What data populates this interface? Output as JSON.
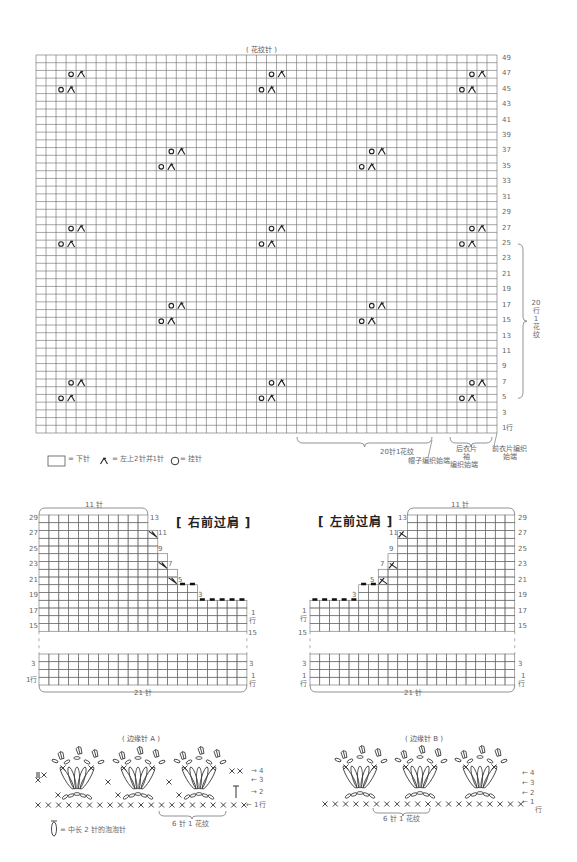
{
  "main_chart": {
    "title": "( 花纹针 )",
    "rows": 49,
    "cols": 46,
    "grid": {
      "x": 36,
      "y": 55,
      "w": 461,
      "h": 378
    },
    "row_labels": [
      "49",
      "47",
      "45",
      "43",
      "41",
      "39",
      "37",
      "35",
      "33",
      "31",
      "29",
      "27",
      "25",
      "23",
      "21",
      "19",
      "17",
      "15",
      "13",
      "11",
      "9",
      "7",
      "5",
      "3",
      "1行"
    ],
    "motifs": [
      {
        "row": 47,
        "col": 4
      },
      {
        "row": 45,
        "col": 3
      },
      {
        "row": 47,
        "col": 24
      },
      {
        "row": 45,
        "col": 23
      },
      {
        "row": 47,
        "col": 44
      },
      {
        "row": 45,
        "col": 43
      },
      {
        "row": 37,
        "col": 14
      },
      {
        "row": 35,
        "col": 13
      },
      {
        "row": 37,
        "col": 34
      },
      {
        "row": 35,
        "col": 33
      },
      {
        "row": 27,
        "col": 4
      },
      {
        "row": 25,
        "col": 3
      },
      {
        "row": 27,
        "col": 24
      },
      {
        "row": 25,
        "col": 23
      },
      {
        "row": 27,
        "col": 44
      },
      {
        "row": 25,
        "col": 43
      },
      {
        "row": 17,
        "col": 14
      },
      {
        "row": 15,
        "col": 13
      },
      {
        "row": 17,
        "col": 34
      },
      {
        "row": 15,
        "col": 33
      },
      {
        "row": 7,
        "col": 4
      },
      {
        "row": 5,
        "col": 3
      },
      {
        "row": 7,
        "col": 24
      },
      {
        "row": 5,
        "col": 23
      },
      {
        "row": 7,
        "col": 44
      },
      {
        "row": 5,
        "col": 43
      }
    ],
    "repeat_bracket_label": "20行1花纹",
    "repeat_bracket_chars": [
      "20",
      "行",
      "1",
      "花",
      "纹"
    ],
    "bottom_labels": {
      "pattern_repeat": "20针1花纹",
      "hat_start": "帽子编织始端",
      "back_sleeve_start": [
        "后衣片",
        "袖",
        "编织始端"
      ],
      "front_start": [
        "前衣片编织",
        "始端"
      ]
    },
    "legend": {
      "knit": "= 下针",
      "k2tog": "= 左上2针并1针",
      "yo": "= 挂针"
    }
  },
  "right_shoulder": {
    "title": "[ 右前过肩 ]",
    "top_label": "11 针",
    "bottom_label": "21 针",
    "left_row_labels": [
      "29",
      "27",
      "25",
      "23",
      "21",
      "19",
      "17",
      "15",
      "3",
      "1行"
    ],
    "right_step_labels": [
      "13",
      "11",
      "9",
      "7",
      "5",
      "3"
    ],
    "right_end_labels": [
      "1",
      "行",
      "15",
      "3",
      "1",
      "行"
    ]
  },
  "left_shoulder": {
    "title": "[ 左前过肩 ]",
    "top_label": "11 针",
    "bottom_label": "21 针",
    "right_row_labels": [
      "29",
      "27",
      "25",
      "23",
      "21",
      "19",
      "17",
      "15",
      "3"
    ],
    "left_step_labels": [
      "13",
      "11",
      "9",
      "7",
      "5",
      "3"
    ],
    "left_end_labels": [
      "1",
      "行",
      "15",
      "3",
      "1",
      "行"
    ],
    "right_end_labels": [
      "1",
      "行"
    ]
  },
  "edging_a": {
    "title": "( 边缘针 A )",
    "row_arrows": [
      "→ 4",
      "← 3",
      "→ 2",
      "← 1行"
    ],
    "repeat_label": "6 针 1 花纹",
    "bobble_legend": "= 中长 2 针的泡泡针"
  },
  "edging_b": {
    "title": "( 边缘针 B )",
    "row_arrows": [
      "← 4",
      "← 3",
      "← 2",
      "← 1"
    ],
    "row_suffix": "行",
    "repeat_label": "6 针 1 花纹"
  }
}
